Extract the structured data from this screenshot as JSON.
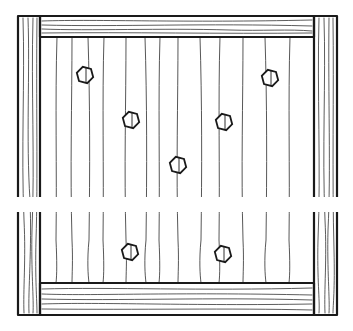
{
  "diagram": {
    "colors": {
      "line": "#1a1a1a",
      "background": "#ffffff"
    },
    "frame": {
      "outer": {
        "x": 18,
        "y": 16,
        "w": 319,
        "h": 299
      },
      "left_stile": {
        "x": 18,
        "w": 22
      },
      "right_stile": {
        "x": 314,
        "w": 23
      },
      "top_rail": {
        "y": 16,
        "h": 21
      },
      "bottom_rail": {
        "y": 283,
        "h": 32
      }
    },
    "break_gap": {
      "y": 197,
      "h": 15
    },
    "board_lines_x": [
      57,
      72,
      88,
      104,
      126,
      145,
      160,
      178,
      200,
      220,
      243,
      265,
      290
    ],
    "bolts": [
      {
        "id": "bolt-1",
        "cx": 85,
        "cy": 75
      },
      {
        "id": "bolt-2",
        "cx": 131,
        "cy": 120
      },
      {
        "id": "bolt-3",
        "cx": 270,
        "cy": 78
      },
      {
        "id": "bolt-4",
        "cx": 224,
        "cy": 122
      },
      {
        "id": "bolt-5",
        "cx": 178,
        "cy": 165
      },
      {
        "id": "bolt-6",
        "cx": 130,
        "cy": 252
      },
      {
        "id": "bolt-7",
        "cx": 223,
        "cy": 254
      }
    ]
  }
}
